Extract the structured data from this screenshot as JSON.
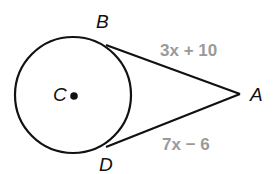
{
  "diagram": {
    "type": "geometry-tangent-segments",
    "circle": {
      "center_label": "C",
      "cx": 73,
      "cy": 95,
      "r": 58
    },
    "points": {
      "A": {
        "label": "A",
        "x": 240,
        "y": 94
      },
      "B": {
        "label": "B",
        "x": 106,
        "y": 45
      },
      "C": {
        "label": "C",
        "x": 73,
        "y": 95
      },
      "D": {
        "label": "D",
        "x": 106,
        "y": 147
      }
    },
    "segments": [
      {
        "from": "A",
        "to": "B",
        "label": "3x + 10"
      },
      {
        "from": "A",
        "to": "D",
        "label": "7x − 6"
      }
    ],
    "colors": {
      "stroke": "#111111",
      "segment_label": "#9a9a9a"
    }
  }
}
